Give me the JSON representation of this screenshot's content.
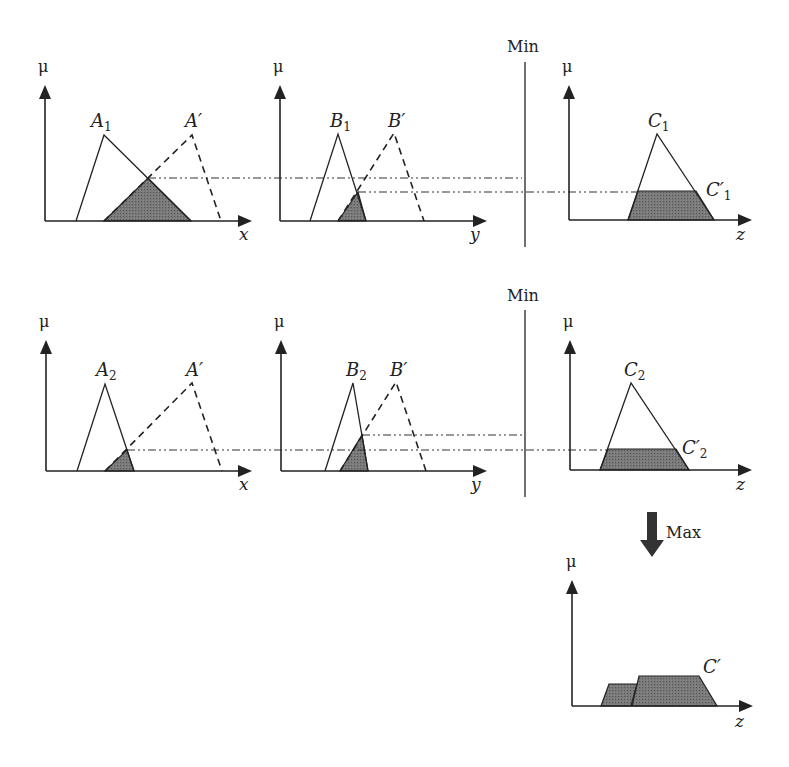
{
  "diagram": {
    "colors": {
      "line": "#222222",
      "fill": "#6e6e6e",
      "dashdot": "#333333",
      "background": "#ffffff"
    },
    "operators": {
      "min_row1": {
        "label": "Min",
        "x": 507,
        "y": 52,
        "line": {
          "x": 525,
          "y1": 62,
          "y2": 247
        }
      },
      "min_row2": {
        "label": "Min",
        "x": 507,
        "y": 301,
        "line": {
          "x": 525,
          "y1": 310,
          "y2": 497
        }
      },
      "max": {
        "label": "Max",
        "x": 666,
        "y": 538,
        "arrow": {
          "x1": 647,
          "x2": 657,
          "y1": 512,
          "y2": 540,
          "hx1": 640,
          "hx2": 664,
          "tip": 557
        }
      }
    },
    "panels": [
      {
        "id": "row1-x",
        "axis": {
          "ox": 45,
          "oy": 221,
          "top": 85,
          "right": 252,
          "ylabel": "μ",
          "xlabel": "x",
          "ylabel_pos": [
            38,
            72
          ],
          "xlabel_pos": [
            239,
            240
          ]
        },
        "sets": [
          {
            "name": "A",
            "sub": "1",
            "style": "solid",
            "points": [
              [
                76,
                221
              ],
              [
                104,
                135
              ],
              [
                191,
                221
              ]
            ],
            "label_pos": [
              91,
              127
            ]
          },
          {
            "name": "A′",
            "sub": "",
            "style": "dashed",
            "points": [
              [
                104,
                221
              ],
              [
                192,
                135
              ],
              [
                221,
                221
              ]
            ],
            "label_pos": [
              185,
              127
            ]
          }
        ],
        "shaded": [
          [
            [
              104,
              221
            ],
            [
              148,
              178
            ],
            [
              191,
              221
            ]
          ]
        ]
      },
      {
        "id": "row1-y",
        "axis": {
          "ox": 280,
          "oy": 221,
          "top": 85,
          "right": 487,
          "ylabel": "μ",
          "xlabel": "y",
          "ylabel_pos": [
            273,
            72
          ],
          "xlabel_pos": [
            470,
            240
          ]
        },
        "sets": [
          {
            "name": "B",
            "sub": "1",
            "style": "solid",
            "points": [
              [
                310,
                221
              ],
              [
                338,
                134
              ],
              [
                366,
                221
              ]
            ],
            "label_pos": [
              330,
              127
            ]
          },
          {
            "name": "B′",
            "sub": "",
            "style": "dashed",
            "points": [
              [
                338,
                221
              ],
              [
                394,
                133
              ],
              [
                424,
                221
              ]
            ],
            "label_pos": [
              388,
              127
            ]
          }
        ],
        "shaded": [
          [
            [
              338,
              221
            ],
            [
              358,
              192
            ],
            [
              366,
              221
            ]
          ]
        ]
      },
      {
        "id": "row1-z",
        "axis": {
          "ox": 569,
          "oy": 220,
          "top": 85,
          "right": 752,
          "ylabel": "μ",
          "xlabel": "z",
          "ylabel_pos": [
            562,
            72
          ],
          "xlabel_pos": [
            736,
            240
          ]
        },
        "sets": [
          {
            "name": "C",
            "sub": "1",
            "style": "solid",
            "points": [
              [
                628,
                220
              ],
              [
                657,
                134
              ],
              [
                714,
                220
              ]
            ],
            "label_pos": [
              648,
              127
            ]
          },
          {
            "name": "C′",
            "sub": "1",
            "style": "label-only",
            "points": [],
            "label_pos": [
              706,
              196
            ]
          }
        ],
        "shaded": [
          [
            [
              628,
              220
            ],
            [
              638,
              191
            ],
            [
              696,
              191
            ],
            [
              714,
              220
            ]
          ]
        ]
      },
      {
        "id": "row2-x",
        "axis": {
          "ox": 46,
          "oy": 471,
          "top": 340,
          "right": 252,
          "ylabel": "μ",
          "xlabel": "x",
          "ylabel_pos": [
            39,
            327
          ],
          "xlabel_pos": [
            239,
            490
          ]
        },
        "sets": [
          {
            "name": "A",
            "sub": "2",
            "style": "solid",
            "points": [
              [
                77,
                471
              ],
              [
                105,
                384
              ],
              [
                134,
                471
              ]
            ],
            "label_pos": [
              96,
              376
            ]
          },
          {
            "name": "A′",
            "sub": "",
            "style": "dashed",
            "points": [
              [
                105,
                471
              ],
              [
                192,
                383
              ],
              [
                222,
                471
              ]
            ],
            "label_pos": [
              186,
              376
            ]
          }
        ],
        "shaded": [
          [
            [
              105,
              471
            ],
            [
              127,
              450
            ],
            [
              134,
              471
            ]
          ]
        ]
      },
      {
        "id": "row2-y",
        "axis": {
          "ox": 281,
          "oy": 471,
          "top": 340,
          "right": 487,
          "ylabel": "μ",
          "xlabel": "y",
          "ylabel_pos": [
            274,
            327
          ],
          "xlabel_pos": [
            471,
            490
          ]
        },
        "sets": [
          {
            "name": "B",
            "sub": "2",
            "style": "solid",
            "points": [
              [
                325,
                471
              ],
              [
                353,
                383
              ],
              [
                368,
                471
              ]
            ],
            "label_pos": [
              346,
              376
            ]
          },
          {
            "name": "B′",
            "sub": "",
            "style": "dashed",
            "points": [
              [
                340,
                471
              ],
              [
                396,
                382
              ],
              [
                426,
                471
              ]
            ],
            "label_pos": [
              390,
              376
            ]
          }
        ],
        "shaded": [
          [
            [
              340,
              471
            ],
            [
              362,
              435
            ],
            [
              368,
              471
            ]
          ]
        ]
      },
      {
        "id": "row2-z",
        "axis": {
          "ox": 570,
          "oy": 470,
          "top": 340,
          "right": 752,
          "ylabel": "μ",
          "xlabel": "z",
          "ylabel_pos": [
            563,
            327
          ],
          "xlabel_pos": [
            736,
            490
          ]
        },
        "sets": [
          {
            "name": "C",
            "sub": "2",
            "style": "solid",
            "points": [
              [
                600,
                470
              ],
              [
                631,
                383
              ],
              [
                689,
                470
              ]
            ],
            "label_pos": [
              624,
              376
            ]
          },
          {
            "name": "C′",
            "sub": "2",
            "style": "label-only",
            "points": [],
            "label_pos": [
              682,
              454
            ]
          }
        ],
        "shaded": [
          [
            [
              600,
              470
            ],
            [
              608,
              449
            ],
            [
              676,
              449
            ],
            [
              689,
              470
            ]
          ]
        ]
      },
      {
        "id": "output-z",
        "axis": {
          "ox": 572,
          "oy": 706,
          "top": 580,
          "right": 753,
          "ylabel": "μ",
          "xlabel": "z",
          "ylabel_pos": [
            566,
            567
          ],
          "xlabel_pos": [
            735,
            727
          ]
        },
        "sets": [
          {
            "name": "C′",
            "sub": "",
            "style": "label-only",
            "points": [],
            "label_pos": [
              703,
              673
            ]
          }
        ],
        "shaded": [
          [
            [
              601,
              706
            ],
            [
              609,
              684
            ],
            [
              637,
              684
            ],
            [
              631,
              706
            ]
          ],
          [
            [
              632,
              706
            ],
            [
              639,
              676
            ],
            [
              699,
              676
            ],
            [
              717,
              706
            ]
          ]
        ]
      }
    ],
    "dashdot_lines": [
      {
        "id": "row1-a-level",
        "y": 178,
        "x1": 148,
        "x2": 522
      },
      {
        "id": "row1-b-level",
        "y": 192,
        "x1": 358,
        "x2": 638
      },
      {
        "id": "row2-b-level",
        "y": 435,
        "x1": 362,
        "x2": 525
      },
      {
        "id": "row2-a-level",
        "y": 450,
        "x1": 127,
        "x2": 608
      }
    ]
  }
}
